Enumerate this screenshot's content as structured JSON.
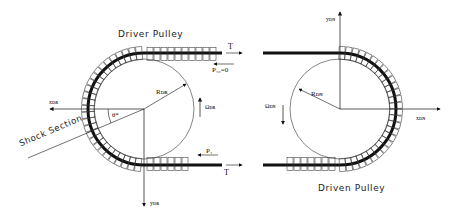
{
  "diagram": {
    "driver": {
      "title": "Driver Pulley",
      "tension_top": "T",
      "tension_bottom": "T",
      "load_top": "P₁₀=0",
      "load_bottom": "P₁",
      "radius_label": "R_DR",
      "radius_text": "Rᴅʀ",
      "omega_label": "Ωᴅʀ",
      "x_axis": "xᴅʀ",
      "y_axis": "yᴅʀ",
      "angle": "θ*",
      "shock_section": "Shock Section"
    },
    "driven": {
      "title": "Driven Pulley",
      "radius_text": "Rᴅɴ",
      "omega_label": "Ωᴅɴ",
      "x_axis": "xᴅɴ",
      "y_axis": "yᴅɴ"
    },
    "colors": {
      "line": "#111111",
      "belt": "#111111",
      "background": "#ffffff"
    }
  }
}
